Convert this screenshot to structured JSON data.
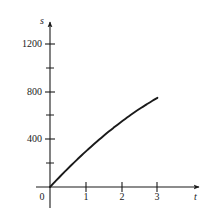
{
  "chart_data": {
    "type": "line",
    "title": "",
    "subtitle": "",
    "xlabel": "t",
    "ylabel": "s",
    "xlim": [
      0,
      3.6
    ],
    "ylim": [
      0,
      1400
    ],
    "grid": false,
    "legend": null,
    "annotations": [],
    "x_ticks": [
      {
        "value": 0,
        "label": "0"
      },
      {
        "value": 1,
        "label": "1"
      },
      {
        "value": 2,
        "label": "2"
      },
      {
        "value": 3,
        "label": "3"
      }
    ],
    "y_ticks": [
      {
        "value": 200,
        "label": "",
        "minor": true
      },
      {
        "value": 400,
        "label": "400",
        "minor": false
      },
      {
        "value": 600,
        "label": "",
        "minor": true
      },
      {
        "value": 800,
        "label": "800",
        "minor": false
      },
      {
        "value": 1000,
        "label": "",
        "minor": true
      },
      {
        "value": 1200,
        "label": "1200",
        "minor": false
      }
    ],
    "origin_label": "0",
    "series": [
      {
        "name": "s(t)",
        "color": "#1a1a1a",
        "x": [
          0.0,
          0.15,
          0.3,
          0.45,
          0.6,
          0.75,
          0.9,
          1.05,
          1.2,
          1.35,
          1.5,
          1.65,
          1.8,
          1.95,
          2.1,
          2.25,
          2.4,
          2.55,
          2.7,
          2.85,
          3.0
        ],
        "y": [
          0,
          68,
          135,
          200,
          264,
          326,
          387,
          446,
          504,
          560,
          615,
          668,
          719,
          769,
          817,
          863,
          908,
          951,
          992,
          1032,
          1070
        ]
      }
    ],
    "colors": {
      "axis": "#1a1a1a",
      "curve": "#1a1a1a",
      "text": "#1a1a1a",
      "background": "#ffffff"
    }
  },
  "geometry": {
    "origin_px": {
      "x": 50,
      "y": 187
    },
    "x_unit_px": 35.8,
    "y_per_px": 12.0,
    "x_axis_end_px": 203,
    "y_axis_end_px": 18,
    "y_axis_bottom_px": 208
  },
  "labels": {
    "y_axis_name": "s",
    "x_axis_name": "t",
    "origin": "0",
    "y_1200": "1200",
    "y_800": "800",
    "y_400": "400",
    "x_1": "1",
    "x_2": "2",
    "x_3": "3"
  }
}
